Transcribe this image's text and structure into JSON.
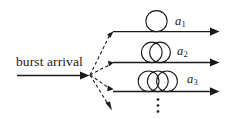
{
  "figure": {
    "kind": "burst-arrival-fiber-delay-line-diagram",
    "background_color": "#ffffff",
    "ink_color": "#1a1a1a",
    "input": {
      "label": "burst arrival",
      "arrow_name": "input-arrow"
    },
    "branch_point": {
      "x": 89,
      "y": 75,
      "style": "dashed",
      "count": 4
    },
    "branches": [
      {
        "id": "branch-1",
        "label": "a",
        "subscript": "1",
        "loops": 1,
        "line_y": 31,
        "line_x_start": 113,
        "line_x_end": 219
      },
      {
        "id": "branch-2",
        "label": "a",
        "subscript": "2",
        "loops": 2,
        "line_y": 62,
        "line_x_start": 113,
        "line_x_end": 219
      },
      {
        "id": "branch-3",
        "label": "a",
        "subscript": "3",
        "loops": 3,
        "line_y": 91,
        "line_x_start": 113,
        "line_x_end": 219
      }
    ],
    "continuation": {
      "name": "vertical-ellipsis",
      "glyph": "⋮",
      "dots": 3,
      "x": 158,
      "y_start": 99,
      "y_end": 112
    }
  }
}
